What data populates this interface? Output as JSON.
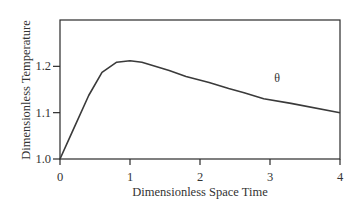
{
  "chart_data": {
    "type": "line",
    "title": "",
    "xlabel": "Dimensionless Space Time",
    "ylabel": "Dimensionless Temperature",
    "xlim": [
      0,
      4
    ],
    "ylim": [
      1.0,
      1.3
    ],
    "xticks": [
      0,
      1,
      2,
      3,
      4
    ],
    "xtick_labels": [
      "0",
      "1",
      "2",
      "3",
      "4"
    ],
    "yticks": [
      1.0,
      1.1,
      1.2
    ],
    "ytick_labels": [
      "1.0",
      "1.1",
      "1.2"
    ],
    "grid": false,
    "legend": null,
    "series": [
      {
        "name": "θ",
        "x": [
          0,
          0.17,
          0.41,
          0.6,
          0.81,
          1.0,
          1.17,
          1.56,
          1.8,
          2.13,
          2.41,
          2.63,
          2.91,
          3.3,
          4.0
        ],
        "values": [
          1.0,
          1.057,
          1.137,
          1.187,
          1.209,
          1.212,
          1.209,
          1.191,
          1.178,
          1.165,
          1.152,
          1.143,
          1.13,
          1.12,
          1.1
        ]
      }
    ],
    "annotations": [
      {
        "text": "θ",
        "x": 3.1,
        "y": 1.142
      }
    ]
  }
}
